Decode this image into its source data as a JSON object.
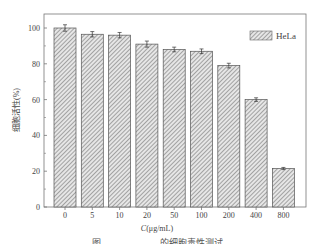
{
  "chart_data": {
    "type": "bar",
    "title": "",
    "categories": [
      "0",
      "5",
      "10",
      "20",
      "50",
      "100",
      "200",
      "400",
      "800"
    ],
    "series": [
      {
        "name": "HeLa",
        "values": [
          100,
          96.5,
          96,
          91,
          88,
          87,
          79,
          60,
          21.5
        ],
        "errors": [
          1.8,
          1.5,
          1.5,
          1.7,
          1.3,
          1.3,
          1.3,
          1.0,
          0.6
        ]
      }
    ],
    "xlabel": "C(μg/mL)",
    "ylabel": "细胞活性(%)",
    "ylim": [
      0,
      105
    ],
    "yticks": [
      0,
      20,
      40,
      60,
      80,
      100
    ],
    "legend": {
      "position": "upper right",
      "entries": [
        "HeLa"
      ]
    },
    "grid": false,
    "bar_style": "hatched diagonal, gray"
  },
  "labels": {
    "xlabel_italic": "C",
    "xlabel_rest": "(μg/mL)",
    "ylabel": "细胞活性(%)",
    "legend": "HeLa",
    "caption": "图 ……………… 的细胞毒性测试"
  }
}
